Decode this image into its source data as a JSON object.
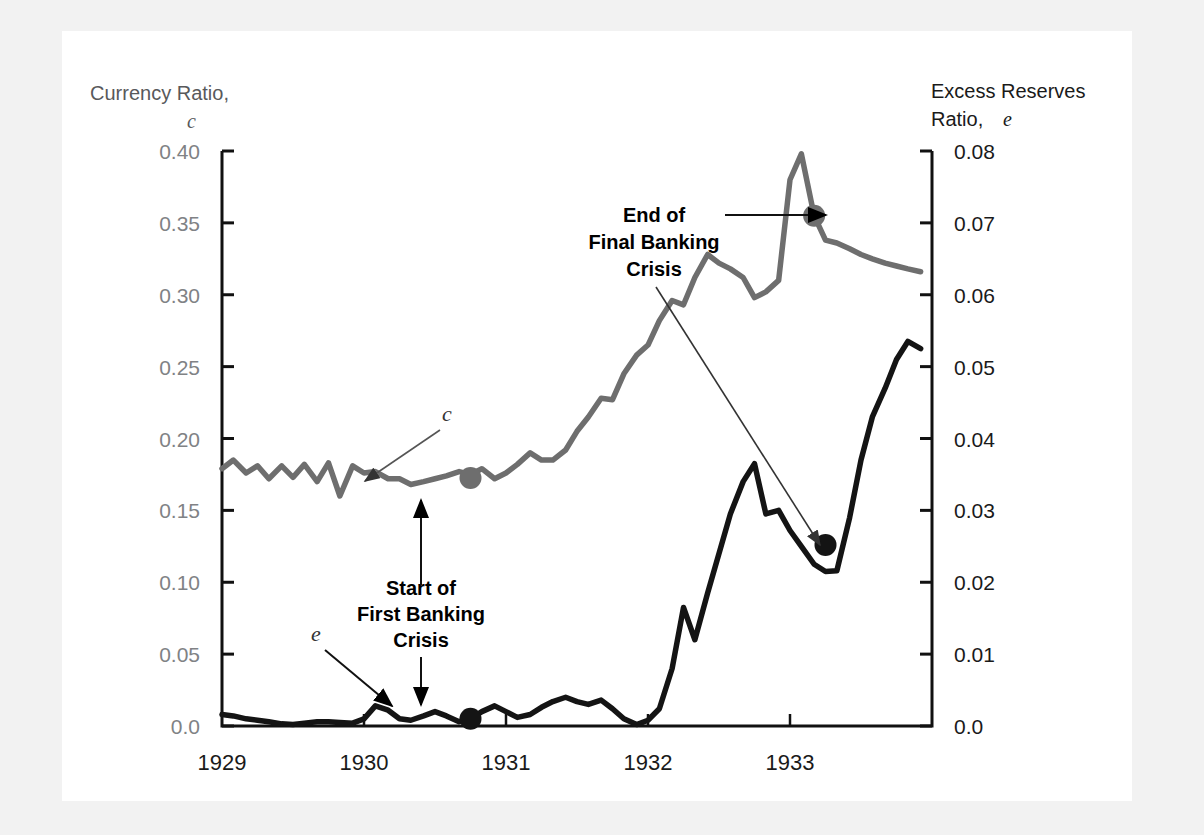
{
  "figure": {
    "background_color": "#f2f2f2",
    "panel_color": "#ffffff"
  },
  "axes": {
    "left": {
      "title_line1": "Currency Ratio,",
      "title_line2": "c",
      "ticks": [
        "0.40",
        "0.35",
        "0.30",
        "0.25",
        "0.20",
        "0.15",
        "0.10",
        "0.05",
        "0.0"
      ],
      "min": 0.0,
      "max": 0.4
    },
    "right": {
      "title_line1": "Excess Reserves",
      "title_line2_prefix": "Ratio, ",
      "title_line2_symbol": "e",
      "ticks": [
        "0.08",
        "0.07",
        "0.06",
        "0.05",
        "0.04",
        "0.03",
        "0.02",
        "0.01",
        "0.0"
      ],
      "min": 0.0,
      "max": 0.08
    },
    "bottom": {
      "ticks": [
        "1929",
        "1930",
        "1931",
        "1932",
        "1933"
      ]
    }
  },
  "annotations": {
    "start_crisis": {
      "line1": "Start of",
      "line2": "First Banking",
      "line3": "Crisis"
    },
    "end_crisis": {
      "line1": "End of",
      "line2": "Final Banking",
      "line3": "Crisis"
    },
    "c_label": "c",
    "e_label": "e"
  },
  "colors": {
    "currency_line": "#6e6e6e",
    "excess_line": "#141414",
    "axis": "#111111",
    "tick_label_left": "#808285",
    "tick_label_right": "#1a1a1a",
    "panel": "#ffffff",
    "outer": "#f2f2f2"
  },
  "chart_data": {
    "type": "line",
    "title": "",
    "xlabel": "",
    "ylabel": "Currency Ratio, c",
    "y2label": "Excess Reserves Ratio, e",
    "xlim": [
      1929.0,
      1934.0
    ],
    "ylim": [
      0.0,
      0.4
    ],
    "y2lim": [
      0.0,
      0.08
    ],
    "grid": false,
    "legend": "inline-labels",
    "xticks": [
      1929,
      1930,
      1931,
      1932,
      1933
    ],
    "series": [
      {
        "name": "c",
        "label": "Currency Ratio, c",
        "axis": "left",
        "color": "#6e6e6e",
        "x": [
          1929.0,
          1929.08,
          1929.17,
          1929.25,
          1929.33,
          1929.42,
          1929.5,
          1929.58,
          1929.67,
          1929.75,
          1929.83,
          1929.92,
          1930.0,
          1930.08,
          1930.17,
          1930.25,
          1930.33,
          1930.42,
          1930.5,
          1930.58,
          1930.67,
          1930.75,
          1930.83,
          1930.92,
          1931.0,
          1931.08,
          1931.17,
          1931.25,
          1931.33,
          1931.42,
          1931.5,
          1931.58,
          1931.67,
          1931.75,
          1931.83,
          1931.92,
          1932.0,
          1932.08,
          1932.17,
          1932.25,
          1932.33,
          1932.42,
          1932.5,
          1932.58,
          1932.67,
          1932.75,
          1932.83,
          1932.92,
          1933.0,
          1933.08,
          1933.17,
          1933.25,
          1933.33,
          1933.42,
          1933.5,
          1933.58,
          1933.67,
          1933.75,
          1933.83,
          1933.92
        ],
        "values": [
          0.179,
          0.185,
          0.176,
          0.181,
          0.172,
          0.181,
          0.173,
          0.182,
          0.17,
          0.183,
          0.16,
          0.181,
          0.176,
          0.177,
          0.172,
          0.172,
          0.168,
          0.17,
          0.172,
          0.174,
          0.177,
          0.175,
          0.179,
          0.172,
          0.176,
          0.182,
          0.19,
          0.185,
          0.185,
          0.192,
          0.205,
          0.215,
          0.228,
          0.227,
          0.245,
          0.258,
          0.265,
          0.282,
          0.296,
          0.293,
          0.312,
          0.328,
          0.322,
          0.318,
          0.312,
          0.298,
          0.302,
          0.31,
          0.38,
          0.398,
          0.355,
          0.338,
          0.336,
          0.332,
          0.328,
          0.325,
          0.322,
          0.32,
          0.318,
          0.316
        ]
      },
      {
        "name": "e",
        "label": "Excess Reserves Ratio, e",
        "axis": "right",
        "color": "#141414",
        "x": [
          1929.0,
          1929.08,
          1929.17,
          1929.25,
          1929.33,
          1929.42,
          1929.5,
          1929.58,
          1929.67,
          1929.75,
          1929.83,
          1929.92,
          1930.0,
          1930.08,
          1930.17,
          1930.25,
          1930.33,
          1930.42,
          1930.5,
          1930.58,
          1930.67,
          1930.75,
          1930.83,
          1930.92,
          1931.0,
          1931.08,
          1931.17,
          1931.25,
          1931.33,
          1931.42,
          1931.5,
          1931.58,
          1931.67,
          1931.75,
          1931.83,
          1931.92,
          1932.0,
          1932.08,
          1932.17,
          1932.25,
          1932.33,
          1932.42,
          1932.5,
          1932.58,
          1932.67,
          1932.75,
          1932.83,
          1932.92,
          1933.0,
          1933.08,
          1933.17,
          1933.25,
          1933.33,
          1933.42,
          1933.5,
          1933.58,
          1933.67,
          1933.75,
          1933.83,
          1933.92
        ],
        "values": [
          0.0016,
          0.0014,
          0.001,
          0.0008,
          0.0006,
          0.0003,
          0.0002,
          0.0004,
          0.0006,
          0.0006,
          0.0005,
          0.0004,
          0.001,
          0.0028,
          0.0022,
          0.001,
          0.0008,
          0.0014,
          0.002,
          0.0014,
          0.0006,
          0.001,
          0.002,
          0.0028,
          0.002,
          0.0012,
          0.0016,
          0.0026,
          0.0034,
          0.004,
          0.0034,
          0.003,
          0.0036,
          0.0024,
          0.001,
          0.0002,
          0.0008,
          0.0024,
          0.008,
          0.0165,
          0.012,
          0.0185,
          0.024,
          0.0295,
          0.034,
          0.0365,
          0.0295,
          0.03,
          0.0272,
          0.025,
          0.0225,
          0.0215,
          0.0216,
          0.029,
          0.037,
          0.043,
          0.047,
          0.051,
          0.0535,
          0.0525
        ]
      }
    ],
    "markers": [
      {
        "series": "c",
        "x": 1930.75,
        "value": 0.1725,
        "note": "Start of First Banking Crisis",
        "color": "#6e6e6e"
      },
      {
        "series": "e",
        "x": 1930.75,
        "value": 0.001,
        "note": "Start of First Banking Crisis",
        "color": "#141414"
      },
      {
        "series": "c",
        "x": 1933.17,
        "value": 0.355,
        "note": "End of Final Banking Crisis",
        "color": "#6e6e6e"
      },
      {
        "series": "e",
        "x": 1933.25,
        "value": 0.0252,
        "note": "End of Final Banking Crisis",
        "color": "#141414"
      }
    ]
  }
}
